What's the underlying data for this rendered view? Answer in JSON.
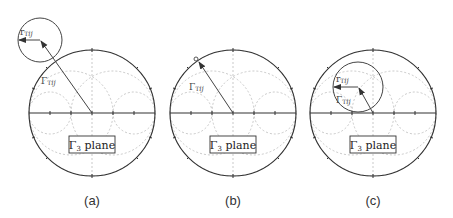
{
  "panels": [
    {
      "id": "a",
      "caption": "(a)",
      "plane_label": "Γ₃ plane",
      "vector_label": "ΓTij",
      "radius_label": "rTij",
      "cx": 92,
      "cy": 113,
      "small_circle": {
        "cx": 40,
        "cy": 40,
        "r": 22
      },
      "vector_tip": [
        40,
        40
      ],
      "radius_tip": [
        18,
        40
      ]
    },
    {
      "id": "b",
      "caption": "(b)",
      "plane_label": "Γ₃ plane",
      "vector_label": "ΓTij",
      "cx": 233,
      "cy": 113,
      "small_circle": {
        "cx": 196,
        "cy": 58,
        "r": 2
      },
      "vector_tip": [
        198,
        61
      ]
    },
    {
      "id": "c",
      "caption": "(c)",
      "plane_label": "Γ₃ plane",
      "vector_label": "ΓTij",
      "radius_label": "rTij",
      "cx": 373,
      "cy": 113,
      "small_circle": {
        "cx": 358,
        "cy": 87,
        "r": 25
      },
      "vector_tip": [
        358,
        87
      ],
      "radius_tip": [
        333,
        87
      ]
    }
  ],
  "chart_radius": 63,
  "colors": {
    "outline": "#333333",
    "grid": "#bbbbbb",
    "vector": "#444444"
  }
}
